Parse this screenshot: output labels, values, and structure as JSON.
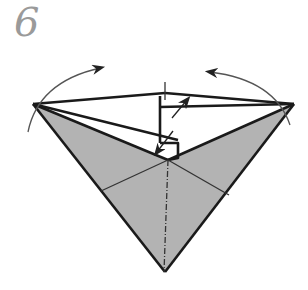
{
  "step": {
    "number": "6"
  },
  "diagram": {
    "type": "origami-fold-step",
    "fill_color": "#b3b3b3",
    "line_color": "#1a1a1a",
    "arrow_color": "#222222",
    "arc_color": "#555555",
    "arrows": [
      {
        "name": "left-fold-arrow",
        "direction": "clockwise-over-top"
      },
      {
        "name": "right-fold-arrow",
        "direction": "counterclockwise-over-top"
      },
      {
        "name": "upper-push-arrow",
        "direction": "up-right"
      },
      {
        "name": "lower-push-arrow",
        "direction": "down-left"
      }
    ],
    "fold_lines": [
      {
        "name": "center-mountain-fold",
        "style": "dash-dot"
      }
    ]
  }
}
